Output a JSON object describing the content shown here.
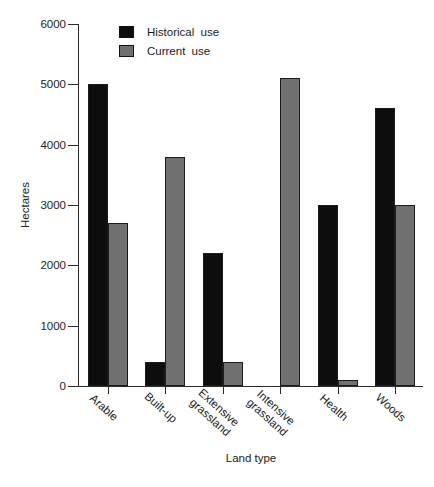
{
  "chart_data": {
    "type": "bar",
    "title": "",
    "xlabel": "Land type",
    "ylabel": "Hectares",
    "ylim": [
      0,
      6000
    ],
    "yticks": [
      0,
      1000,
      2000,
      3000,
      4000,
      5000,
      6000
    ],
    "categories": [
      "Arable",
      "Built-up",
      "Extensive\ngrassland",
      "Intensive\ngrassland",
      "Health",
      "Woods"
    ],
    "series": [
      {
        "name": "Historical use",
        "color": "#0d0d0d",
        "values": [
          5000,
          400,
          2200,
          0,
          3000,
          4600
        ]
      },
      {
        "name": "Current use",
        "color": "#707070",
        "values": [
          2700,
          3800,
          400,
          5100,
          100,
          3000
        ]
      }
    ],
    "legend_position": "top-left-inside",
    "grid": false,
    "axis_color": "#2b2b2b"
  }
}
